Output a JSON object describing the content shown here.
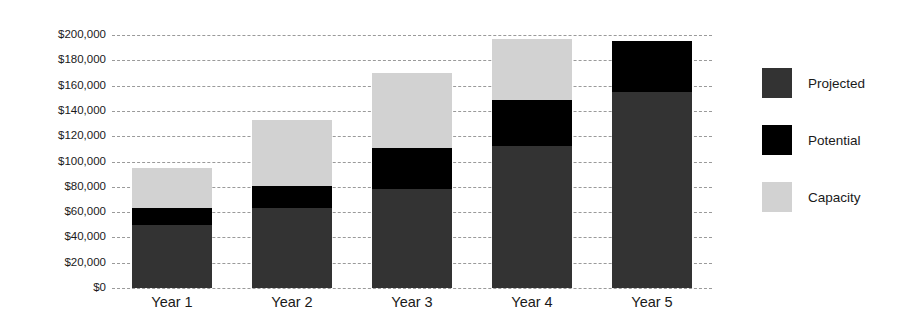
{
  "chart_data": {
    "type": "bar",
    "subtype": "stacked-bar",
    "title": "",
    "xlabel": "",
    "ylabel": "",
    "categories": [
      "Year 1",
      "Year 2",
      "Year 3",
      "Year 4",
      "Year 5"
    ],
    "series": [
      {
        "name": "Projected",
        "color": "#333333",
        "values": [
          50000,
          63000,
          78000,
          112000,
          155000
        ]
      },
      {
        "name": "Potential",
        "color": "#000000",
        "values": [
          13000,
          18000,
          33000,
          37000,
          40000
        ]
      },
      {
        "name": "Capacity",
        "color": "#d2d2d2",
        "values": [
          32000,
          52000,
          59000,
          48000,
          0
        ]
      }
    ],
    "totals": [
      95000,
      133000,
      170000,
      197000,
      195000
    ],
    "ylim": [
      0,
      200000
    ],
    "ytick_values": [
      0,
      20000,
      40000,
      60000,
      80000,
      100000,
      120000,
      140000,
      160000,
      180000,
      200000
    ],
    "ytick_labels": [
      "$0",
      "$20,000",
      "$40,000",
      "$60,000",
      "$80,000",
      "$100,000",
      "$120,000",
      "$140,000",
      "$160,000",
      "$180,000",
      "$200,000"
    ],
    "grid": true,
    "grid_style": "dashed",
    "grid_color": "#9a9a9a",
    "legend_position": "right",
    "legend_entries": [
      "Projected",
      "Potential",
      "Capacity"
    ],
    "background": "#ffffff"
  }
}
